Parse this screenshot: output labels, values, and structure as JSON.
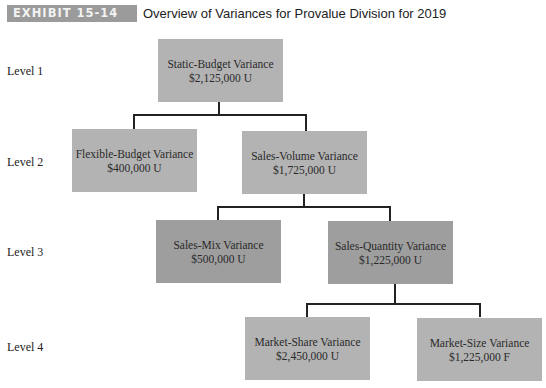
{
  "header": {
    "exhibit": "EXHIBIT 15-14",
    "title": "Overview of Variances for Provalue Division for 2019"
  },
  "levels": [
    "Level 1",
    "Level 2",
    "Level 3",
    "Level 4"
  ],
  "nodes": {
    "static": {
      "name": "Static-Budget Variance",
      "value": "$2,125,000 U"
    },
    "flexible": {
      "name": "Flexible-Budget Variance",
      "value": "$400,000 U"
    },
    "volume": {
      "name": "Sales-Volume Variance",
      "value": "$1,725,000 U"
    },
    "mix": {
      "name": "Sales-Mix Variance",
      "value": "$500,000 U"
    },
    "quantity": {
      "name": "Sales-Quantity Variance",
      "value": "$1,225,000 U"
    },
    "share": {
      "name": "Market-Share Variance",
      "value": "$2,450,000 U"
    },
    "size": {
      "name": "Market-Size Variance",
      "value": "$1,225,000 F"
    }
  }
}
